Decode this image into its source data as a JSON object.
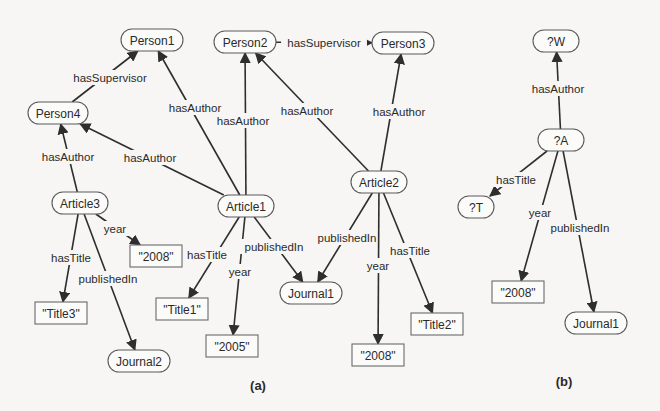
{
  "figure": {
    "panel_a": {
      "caption": "(a)",
      "nodes": [
        {
          "id": "person1",
          "label": "Person1",
          "type": "resource",
          "x": 152,
          "y": 40,
          "w": 62
        },
        {
          "id": "person2",
          "label": "Person2",
          "type": "resource",
          "x": 245,
          "y": 42,
          "w": 62
        },
        {
          "id": "person3",
          "label": "Person3",
          "type": "resource",
          "x": 403,
          "y": 43,
          "w": 62
        },
        {
          "id": "person4",
          "label": "Person4",
          "type": "resource",
          "x": 58,
          "y": 113,
          "w": 60
        },
        {
          "id": "article3",
          "label": "Article3",
          "type": "resource",
          "x": 80,
          "y": 203,
          "w": 56
        },
        {
          "id": "article1",
          "label": "Article1",
          "type": "resource",
          "x": 246,
          "y": 206,
          "w": 56
        },
        {
          "id": "article2",
          "label": "Article2",
          "type": "resource",
          "x": 379,
          "y": 182,
          "w": 56
        },
        {
          "id": "lit2008a",
          "label": "\"2008\"",
          "type": "literal",
          "x": 156,
          "y": 256,
          "w": 52
        },
        {
          "id": "title3",
          "label": "\"Title3\"",
          "type": "literal",
          "x": 61,
          "y": 313,
          "w": 52
        },
        {
          "id": "journal2",
          "label": "Journal2",
          "type": "resource",
          "x": 139,
          "y": 361,
          "w": 62
        },
        {
          "id": "title1",
          "label": "\"Title1\"",
          "type": "literal",
          "x": 182,
          "y": 309,
          "w": 52
        },
        {
          "id": "lit2005",
          "label": "\"2005\"",
          "type": "literal",
          "x": 232,
          "y": 346,
          "w": 52
        },
        {
          "id": "journal1a",
          "label": "Journal1",
          "type": "resource",
          "x": 311,
          "y": 293,
          "w": 62
        },
        {
          "id": "title2",
          "label": "\"Title2\"",
          "type": "literal",
          "x": 437,
          "y": 324,
          "w": 52
        },
        {
          "id": "lit2008b",
          "label": "\"2008\"",
          "type": "literal",
          "x": 378,
          "y": 355,
          "w": 52
        }
      ],
      "edges": [
        {
          "from": "person4",
          "to": "person1",
          "label": "hasSupervisor",
          "lx": 110,
          "ly": 78
        },
        {
          "from": "person2",
          "to": "person3",
          "label": "hasSupervisor",
          "lx": 324,
          "ly": 43
        },
        {
          "from": "article3",
          "to": "person4",
          "label": "hasAuthor",
          "lx": 68,
          "ly": 157
        },
        {
          "from": "article1",
          "to": "person4",
          "label": "hasAuthor",
          "lx": 150,
          "ly": 158
        },
        {
          "from": "article1",
          "to": "person1",
          "label": "hasAuthor",
          "lx": 195,
          "ly": 108
        },
        {
          "from": "article1",
          "to": "person2",
          "label": "hasAuthor",
          "lx": 243,
          "ly": 121
        },
        {
          "from": "article2",
          "to": "person2",
          "label": "hasAuthor",
          "lx": 307,
          "ly": 111
        },
        {
          "from": "article2",
          "to": "person3",
          "label": "hasAuthor",
          "lx": 399,
          "ly": 112
        },
        {
          "from": "article3",
          "to": "lit2008a",
          "label": "year",
          "lx": 115,
          "ly": 229
        },
        {
          "from": "article3",
          "to": "title3",
          "label": "hasTitle",
          "lx": 71,
          "ly": 258
        },
        {
          "from": "article3",
          "to": "journal2",
          "label": "publishedIn",
          "lx": 108,
          "ly": 279
        },
        {
          "from": "article1",
          "to": "title1",
          "label": "hasTitle",
          "lx": 207,
          "ly": 255
        },
        {
          "from": "article1",
          "to": "lit2005",
          "label": "year",
          "lx": 240,
          "ly": 272
        },
        {
          "from": "article1",
          "to": "journal1a",
          "label": "publishedIn",
          "lx": 274,
          "ly": 247
        },
        {
          "from": "article2",
          "to": "journal1a",
          "label": "publishedIn",
          "lx": 347,
          "ly": 238
        },
        {
          "from": "article2",
          "to": "lit2008b",
          "label": "year",
          "lx": 378,
          "ly": 266
        },
        {
          "from": "article2",
          "to": "title2",
          "label": "hasTitle",
          "lx": 410,
          "ly": 251
        }
      ]
    },
    "panel_b": {
      "caption": "(b)",
      "nodes": [
        {
          "id": "varW",
          "label": "?W",
          "type": "resource",
          "x": 556,
          "y": 41,
          "w": 46
        },
        {
          "id": "varA",
          "label": "?A",
          "type": "resource",
          "x": 561,
          "y": 140,
          "w": 46
        },
        {
          "id": "varT",
          "label": "?T",
          "type": "resource",
          "x": 476,
          "y": 207,
          "w": 36
        },
        {
          "id": "lit2008c",
          "label": "\"2008\"",
          "type": "literal",
          "x": 518,
          "y": 292,
          "w": 52
        },
        {
          "id": "journal1b",
          "label": "Journal1",
          "type": "resource",
          "x": 596,
          "y": 323,
          "w": 62
        }
      ],
      "edges": [
        {
          "from": "varA",
          "to": "varW",
          "label": "hasAuthor",
          "lx": 558,
          "ly": 89
        },
        {
          "from": "varA",
          "to": "varT",
          "label": "hasTitle",
          "lx": 516,
          "ly": 180
        },
        {
          "from": "varA",
          "to": "lit2008c",
          "label": "year",
          "lx": 540,
          "ly": 213
        },
        {
          "from": "varA",
          "to": "journal1b",
          "label": "publishedIn",
          "lx": 580,
          "ly": 228
        }
      ]
    },
    "captions": {
      "a": "(a)",
      "b": "(b)"
    },
    "colors": {
      "line": "#2e2e2e",
      "text": "#2a2a2a",
      "background": "#f7f6f4",
      "node_fill": "#fbfbfa"
    }
  }
}
